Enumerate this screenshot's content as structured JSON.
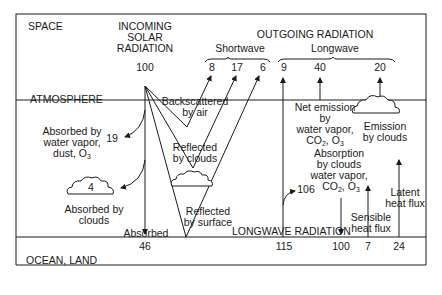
{
  "regions": {
    "space": "SPACE",
    "atmosphere": "ATMOSPHERE",
    "surface": "OCEAN, LAND"
  },
  "incoming": {
    "title_line1": "INCOMING",
    "title_line2": "SOLAR",
    "title_line3": "RADIATION",
    "value": "100"
  },
  "outgoing": {
    "title": "OUTGOING RADIATION",
    "shortwave_label": "Shortwave",
    "longwave_label": "Longwave",
    "shortwave_values": [
      "8",
      "17",
      "6"
    ],
    "longwave_values": [
      "9",
      "40",
      "20"
    ]
  },
  "atmosphere_labels": {
    "backscattered_line1": "Backscattered",
    "backscattered_line2": "by air",
    "reflected_clouds_line1": "Reflected",
    "reflected_clouds_line2": "by clouds",
    "reflected_surface_line1": "Reflected",
    "reflected_surface_line2": "by surface",
    "absorbed_vapor_line1": "Absorbed by",
    "absorbed_vapor_line2": "water vapor,",
    "absorbed_vapor_line3": "dust, O",
    "absorbed_vapor_sub": "3",
    "absorbed_vapor_value": "19",
    "absorbed_clouds_value": "4",
    "absorbed_clouds_line1": "Absorbed by",
    "absorbed_clouds_line2": "clouds",
    "absorbed": "Absorbed",
    "net_emission_line1": "Net emission",
    "net_emission_line2": "by",
    "net_emission_line3": "water vapor,",
    "net_emission_line4_a": "CO",
    "net_emission_line4_sub1": "2",
    "net_emission_line4_b": ", O",
    "net_emission_line4_sub2": "3",
    "emission_clouds_line1": "Emission",
    "emission_clouds_line2": "by clouds",
    "absorption_line1": "Absorption",
    "absorption_line2": "by clouds",
    "absorption_line3": "water vapor,",
    "absorption_line4_a": "CO",
    "absorption_line4_sub1": "2",
    "absorption_line4_b": ", O",
    "absorption_line4_sub2": "3",
    "absorption_value": "106",
    "sensible_line1": "Sensible",
    "sensible_line2": "heat flux",
    "latent_line1": "Latent",
    "latent_line2": "heat flux",
    "longwave_radiation": "LONGWAVE RADIATION"
  },
  "surface_values": {
    "absorbed": "46",
    "longwave_up": "115",
    "longwave_down": "100",
    "sensible": "7",
    "latent": "24"
  },
  "colors": {
    "line": "#1a1a1a",
    "background": "#ffffff"
  }
}
